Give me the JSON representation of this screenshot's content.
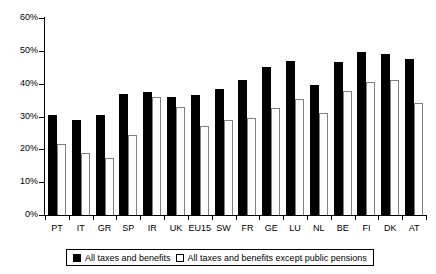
{
  "chart_data": {
    "type": "bar",
    "title": "",
    "xlabel": "",
    "ylabel": "",
    "ylim": [
      0,
      60
    ],
    "ytick_values": [
      0,
      10,
      20,
      30,
      40,
      50,
      60
    ],
    "ytick_labels": [
      "0%",
      "10%",
      "20%",
      "30%",
      "40%",
      "50%",
      "60%"
    ],
    "grid": false,
    "legend_position": "bottom",
    "categories": [
      "PT",
      "IT",
      "GR",
      "SP",
      "IR",
      "UK",
      "EU15",
      "SW",
      "FR",
      "GE",
      "LU",
      "NL",
      "BE",
      "FI",
      "DK",
      "AT"
    ],
    "series": [
      {
        "name": "All taxes and benefits",
        "color": "#000000",
        "values": [
          30.5,
          29.0,
          30.5,
          36.8,
          37.5,
          36.0,
          36.5,
          38.5,
          41.0,
          45.0,
          47.0,
          39.5,
          46.5,
          49.5,
          49.0,
          47.5
        ]
      },
      {
        "name": "All taxes and benefits except public pensions",
        "color": "#ffffff",
        "values": [
          21.5,
          19.0,
          17.5,
          24.5,
          36.0,
          33.0,
          27.0,
          29.0,
          29.5,
          32.5,
          35.3,
          31.0,
          37.8,
          40.5,
          41.0,
          34.0
        ]
      }
    ]
  },
  "legend": {
    "items": [
      {
        "label": "All taxes and benefits",
        "swatch": "filled-square-icon"
      },
      {
        "label": "All taxes and benefits except public pensions",
        "swatch": "hollow-square-icon"
      }
    ]
  }
}
